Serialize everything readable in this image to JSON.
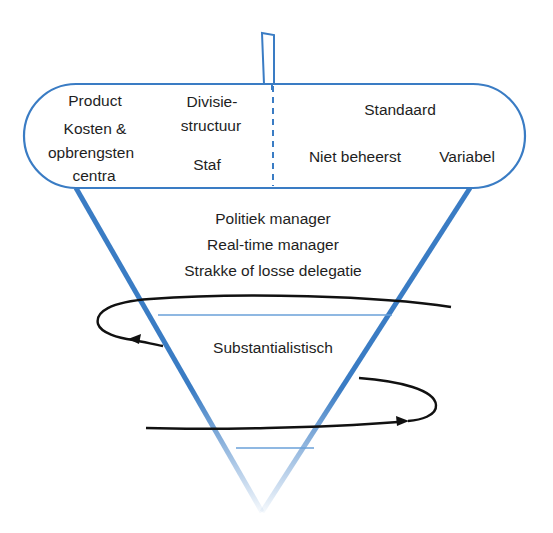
{
  "colors": {
    "blue": "#3a7cc4",
    "blue_light": "#6aa0d8",
    "black": "#111111",
    "text": "#1e1e1e"
  },
  "capsule": {
    "left_column": {
      "line1": "Product",
      "line2": "Kosten &",
      "line3": "opbrengsten",
      "line4": "centra"
    },
    "middle_column": {
      "line1": "Divisie-",
      "line2": "structuur",
      "line3": "Staf"
    },
    "right_section": {
      "top": "Standaard",
      "bottom_left": "Niet beheerst",
      "bottom_right": "Variabel"
    }
  },
  "cone": {
    "upper_band": {
      "line1": "Politiek manager",
      "line2": "Real-time manager",
      "line3": "Strakke of losse delegatie"
    },
    "middle_band": {
      "line1": "Substantialistisch"
    }
  }
}
